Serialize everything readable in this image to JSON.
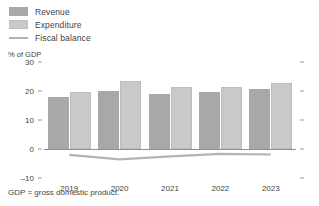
{
  "legend": {
    "items": [
      {
        "label": "Revenue",
        "marker": "square-swatch-icon",
        "color": "#a8a8a8"
      },
      {
        "label": "Expenditure",
        "marker": "square-swatch-icon",
        "color": "#c9c9c9"
      },
      {
        "label": "Fiscal balance",
        "marker": "line-swatch-icon",
        "color": "#b4b4b4"
      }
    ]
  },
  "footnote": "GDP = gross domestic product.",
  "chart_data": {
    "type": "bar",
    "title": "",
    "subtitle": "",
    "xlabel": "",
    "ylabel": "% of GDP",
    "categories": [
      "2019",
      "2020",
      "2021",
      "2022",
      "2023"
    ],
    "ylim": [
      -10,
      30
    ],
    "yticks": [
      30,
      20,
      10,
      0,
      -10
    ],
    "ytick_labels": [
      "30",
      "20",
      "10",
      "0",
      "–10"
    ],
    "grid": false,
    "legend_position": "top-left",
    "series": [
      {
        "name": "Revenue",
        "type": "bar",
        "color": "#a8a8a8",
        "values": [
          17.8,
          20.0,
          18.8,
          19.7,
          20.7
        ]
      },
      {
        "name": "Expenditure",
        "type": "bar",
        "color": "#c9c9c9",
        "values": [
          19.8,
          23.6,
          21.3,
          21.4,
          22.6
        ]
      },
      {
        "name": "Fiscal balance",
        "type": "line",
        "color": "#b4b4b4",
        "values": [
          -2.0,
          -3.6,
          -2.5,
          -1.7,
          -1.9
        ]
      }
    ]
  }
}
